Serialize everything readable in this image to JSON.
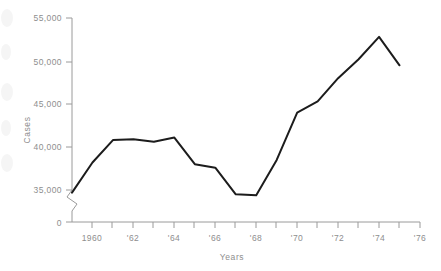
{
  "chart_data": {
    "type": "line",
    "title": "",
    "xlabel": "Years",
    "ylabel": "Cases",
    "grid": false,
    "legend": null,
    "x": [
      1959,
      1960,
      1961,
      1962,
      1963,
      1964,
      1965,
      1966,
      1967,
      1968,
      1969,
      1970,
      1971,
      1972,
      1973,
      1974,
      1975
    ],
    "values": [
      34700,
      38200,
      40800,
      40900,
      40600,
      41100,
      38000,
      37600,
      34500,
      34400,
      38500,
      44000,
      45300,
      48000,
      50200,
      52800,
      49500
    ],
    "series": [
      {
        "name": "Cases",
        "values": [
          34700,
          38200,
          40800,
          40900,
          40600,
          41100,
          38000,
          37600,
          34500,
          34400,
          38500,
          44000,
          45300,
          48000,
          50200,
          52800,
          49500
        ]
      }
    ],
    "xlim": [
      1959,
      1976
    ],
    "ylim": [
      34000,
      55000
    ],
    "y_axis_break": true,
    "y_axis_break_between": [
      0,
      35000
    ],
    "ytick_values": [
      0,
      35000,
      40000,
      45000,
      50000,
      55000
    ],
    "ytick_labels": [
      "0",
      "35,000",
      "40,000",
      "45,000",
      "50,000",
      "55,000"
    ],
    "xtick_values": [
      1959,
      1960,
      1961,
      1962,
      1963,
      1964,
      1965,
      1966,
      1967,
      1968,
      1969,
      1970,
      1971,
      1972,
      1973,
      1974,
      1975,
      1976
    ],
    "xtick_labels": [
      "",
      "1960",
      "",
      "'62",
      "",
      "'64",
      "",
      "'66",
      "",
      "'68",
      "",
      "'70",
      "",
      "'72",
      "",
      "'74",
      "",
      "'76"
    ],
    "line_color": "#1c1c1c",
    "axis_color": "#9a9a9a",
    "label_color": "#8e8e8e",
    "background_color": "#ffffff"
  }
}
